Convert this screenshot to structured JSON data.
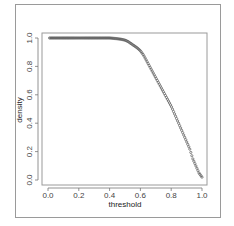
{
  "chart_data": {
    "type": "scatter",
    "title": "",
    "xlabel": "threshold",
    "ylabel": "density",
    "xlim": [
      0,
      1
    ],
    "ylim": [
      0,
      1
    ],
    "grid": false,
    "legend": null,
    "x_ticks": [
      "0.0",
      "0.2",
      "0.4",
      "0.6",
      "0.8",
      "1.0"
    ],
    "y_ticks": [
      "0.0",
      "0.2",
      "0.4",
      "0.6",
      "0.8",
      "1.0"
    ],
    "series": [
      {
        "name": "density",
        "marker": "open-circle",
        "color": "#555555",
        "x": [
          0.0,
          0.05,
          0.1,
          0.15,
          0.2,
          0.25,
          0.3,
          0.35,
          0.4,
          0.45,
          0.48,
          0.5,
          0.52,
          0.54,
          0.56,
          0.58,
          0.6,
          0.62,
          0.64,
          0.66,
          0.68,
          0.7,
          0.72,
          0.74,
          0.76,
          0.78,
          0.8,
          0.82,
          0.84,
          0.86,
          0.88,
          0.9,
          0.92,
          0.94,
          0.96,
          0.98,
          1.0
        ],
        "values": [
          1.0,
          1.0,
          1.0,
          1.0,
          1.0,
          1.0,
          1.0,
          1.0,
          1.0,
          0.995,
          0.99,
          0.985,
          0.975,
          0.96,
          0.945,
          0.93,
          0.91,
          0.88,
          0.84,
          0.8,
          0.76,
          0.72,
          0.68,
          0.64,
          0.6,
          0.56,
          0.52,
          0.47,
          0.42,
          0.37,
          0.32,
          0.27,
          0.22,
          0.15,
          0.1,
          0.05,
          0.02
        ]
      }
    ]
  }
}
